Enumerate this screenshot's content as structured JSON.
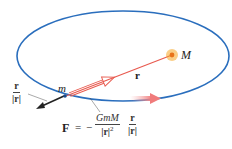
{
  "labels": {
    "M": "M",
    "m": "m",
    "r": "r",
    "unit_num": "r",
    "unit_den": "|r|",
    "force_lhs": "F",
    "equals": "=",
    "minus": "−",
    "force_num": "GmM",
    "force_den": "|r|",
    "force_den_exp": "2",
    "force_unit_num": "r",
    "force_unit_den": "|r|"
  },
  "colors": {
    "orbit": "#2a6ebd",
    "radius": "#e85a4f",
    "star": "#f5a623",
    "force_arrow": "#222222",
    "velocity_arrow": "#f08a8a"
  }
}
